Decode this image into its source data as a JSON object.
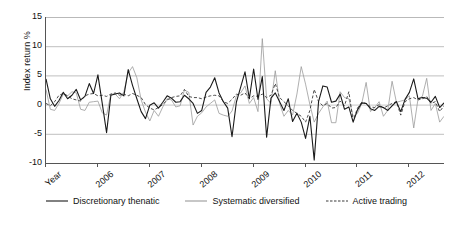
{
  "chart_data": {
    "type": "line",
    "title": "",
    "xlabel": "Year",
    "ylabel": "Index return %",
    "ylim": [
      -10,
      15
    ],
    "yticks": [
      15,
      10,
      5,
      0,
      -5,
      -10
    ],
    "ytick_labels": [
      "15",
      "10",
      "5",
      "0",
      "-5",
      "-10"
    ],
    "xtick_labels": [
      "Year",
      "2006",
      "2007",
      "2008",
      "2009",
      "2010",
      "2011",
      "2012"
    ],
    "xtick_positions": [
      0,
      12,
      24,
      36,
      48,
      60,
      72,
      84
    ],
    "grid": "horizontal",
    "legend_position": "bottom",
    "x_start": "2005-01",
    "x_count": 93,
    "colors": {
      "discretionary_thematic": "#1a1a1a",
      "systematic_diversified": "#9a9a9a",
      "active_trading": "#3a3a3a",
      "gridline": "#b8b8b8",
      "axis": "#555555",
      "background": "#ffffff"
    },
    "series": [
      {
        "name": "Discretionary thenatic",
        "style": "solid",
        "color": "#1a1a1a",
        "width": 1.1,
        "values": [
          4.4,
          1.0,
          -0.3,
          0.7,
          2.1,
          1.0,
          1.6,
          2.6,
          0.8,
          1.4,
          3.6,
          1.9,
          5.1,
          0.2,
          -4.8,
          1.6,
          1.8,
          2.0,
          1.5,
          6.0,
          3.3,
          1.0,
          -1.2,
          -2.4,
          -0.1,
          0.3,
          -0.6,
          0.4,
          1.5,
          1.1,
          0.4,
          0.5,
          1.6,
          1.0,
          0.2,
          -1.5,
          -1.0,
          2.1,
          3.0,
          4.6,
          2.0,
          0.5,
          -0.6,
          -5.5,
          0.4,
          3.0,
          5.6,
          1.0,
          6.1,
          0.9,
          4.8,
          -5.6,
          1.1,
          2.0,
          0.5,
          -1.0,
          1.0,
          -2.9,
          -1.5,
          -3.0,
          -5.8,
          -2.0,
          -9.5,
          0.5,
          3.2,
          3.0,
          0.4,
          0.6,
          1.8,
          -0.8,
          -0.4,
          -3.0,
          -0.9,
          0.3,
          0.2,
          -0.7,
          -1.0,
          -0.3,
          -0.5,
          -1.0,
          -0.2,
          0.5,
          -1.2,
          0.9,
          2.1,
          4.4,
          1.0,
          1.2,
          1.1,
          0.4,
          1.4,
          -0.5,
          0.3,
          1.0,
          -1.1,
          0.6,
          1.2,
          3.5,
          -0.6,
          -6.6,
          5.2,
          0.4,
          0.9,
          4.1,
          0.5,
          -0.9,
          0.7,
          1.6,
          0.4
        ]
      },
      {
        "name": "Systematic diversified",
        "style": "solid",
        "color": "#9a9a9a",
        "width": 0.8,
        "values": [
          2.6,
          -0.8,
          -1.0,
          0.2,
          1.8,
          1.5,
          2.2,
          2.0,
          -0.8,
          -1.0,
          0.4,
          0.5,
          0.6,
          -1.4,
          -1.8,
          1.8,
          1.8,
          1.0,
          2.2,
          5.4,
          6.5,
          4.6,
          0.8,
          -1.3,
          -2.8,
          -1.0,
          -2.0,
          -0.4,
          1.0,
          0.8,
          -0.4,
          -0.2,
          2.5,
          2.1,
          -3.5,
          -2.0,
          -1.4,
          -0.4,
          0.2,
          0.8,
          -1.5,
          -1.8,
          -2.0,
          -1.1,
          1.5,
          2.0,
          3.2,
          0.2,
          1.2,
          -1.2,
          11.3,
          1.0,
          0.2,
          5.8,
          0.2,
          -2.0,
          -1.0,
          -1.8,
          1.8,
          6.5,
          3.5,
          0.0,
          -3.0,
          -1.5,
          -0.4,
          0.6,
          -3.1,
          -3.1,
          2.2,
          1.2,
          1.0,
          -2.0,
          -1.5,
          0.2,
          3.8,
          -1.2,
          -0.5,
          0.5,
          -2.0,
          -1.0,
          4.0,
          0.4,
          0.6,
          0.8,
          1.5,
          -4.0,
          1.0,
          1.4,
          4.5,
          -1.0,
          0.2,
          -3.0,
          -2.0,
          1.0,
          -1.5,
          -0.4,
          1.7,
          4.5,
          0.2,
          -1.5,
          1.5,
          -2.0,
          -4.5,
          0.3,
          2.5,
          -0.5,
          2.5,
          -1.0,
          -1.6
        ]
      },
      {
        "name": "Active trading",
        "style": "dashed",
        "color": "#3a3a3a",
        "width": 0.9,
        "values": [
          0.2,
          -0.2,
          0.5,
          1.6,
          1.9,
          1.5,
          1.0,
          0.8,
          0.6,
          1.5,
          1.8,
          1.9,
          1.5,
          1.6,
          1.4,
          1.8,
          2.0,
          1.6,
          1.8,
          1.5,
          1.9,
          1.6,
          1.2,
          0.0,
          -0.6,
          -0.9,
          -0.5,
          0.0,
          0.8,
          1.2,
          1.4,
          1.5,
          2.6,
          1.4,
          1.2,
          1.2,
          1.0,
          1.3,
          1.5,
          1.6,
          1.5,
          0.5,
          0.2,
          0.9,
          1.8,
          1.6,
          2.0,
          1.0,
          1.5,
          1.4,
          1.8,
          1.2,
          1.6,
          3.6,
          1.2,
          0.5,
          -0.2,
          -1.0,
          -1.5,
          -2.0,
          -3.0,
          -1.0,
          2.6,
          0.5,
          -0.2,
          0.2,
          -0.6,
          -0.5,
          0.6,
          -0.2,
          2.2,
          -2.8,
          -0.6,
          0.4,
          0.2,
          -0.4,
          -0.5,
          0.0,
          -0.6,
          -0.2,
          0.2,
          0.5,
          -1.8,
          0.5,
          1.0,
          1.2,
          0.8,
          1.0,
          1.4,
          0.2,
          0.5,
          -1.2,
          -0.2,
          0.6,
          -0.8,
          0.2,
          0.5,
          1.5,
          -1.5,
          -1.0,
          0.5,
          0.2,
          -0.8,
          0.4,
          0.6,
          -0.5,
          1.0,
          0.2,
          0.3
        ]
      }
    ]
  },
  "legend": {
    "items": [
      {
        "label": "Discretionary thenatic",
        "style": "solid",
        "color": "#1a1a1a"
      },
      {
        "label": "Systematic diversified",
        "style": "solid",
        "color": "#9a9a9a"
      },
      {
        "label": "Active trading",
        "style": "dashed",
        "color": "#3a3a3a"
      }
    ]
  }
}
